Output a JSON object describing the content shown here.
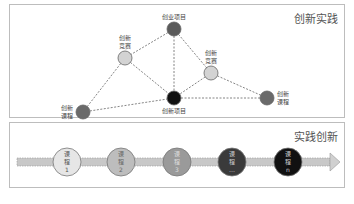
{
  "top_panel": {
    "title": "创新实践",
    "nodes": [
      {
        "id": "startup",
        "label_lines": [
          "创业项目"
        ],
        "color": "#5b5b5b",
        "label_pos": "above"
      },
      {
        "id": "comp1",
        "label_lines": [
          "创新",
          "竞赛"
        ],
        "color": "#d3d3d3",
        "label_pos": "above"
      },
      {
        "id": "comp2",
        "label_lines": [
          "创新",
          "竞赛"
        ],
        "color": "#d3d3d3",
        "label_pos": "above"
      },
      {
        "id": "project",
        "label_lines": [
          "创新项目"
        ],
        "color": "#111111",
        "label_pos": "below"
      },
      {
        "id": "course1",
        "label_lines": [
          "创新",
          "课程"
        ],
        "color": "#6a6a6a",
        "label_pos": "left"
      },
      {
        "id": "course2",
        "label_lines": [
          "创新",
          "课程"
        ],
        "color": "#6a6a6a",
        "label_pos": "right"
      }
    ],
    "edges": [
      [
        "startup",
        "comp1"
      ],
      [
        "startup",
        "project"
      ],
      [
        "startup",
        "comp2"
      ],
      [
        "comp1",
        "course1"
      ],
      [
        "comp1",
        "project"
      ],
      [
        "comp2",
        "project"
      ],
      [
        "comp2",
        "course2"
      ],
      [
        "course1",
        "project"
      ],
      [
        "project",
        "course2"
      ]
    ]
  },
  "bottom_panel": {
    "title": "实践创新",
    "courses": [
      {
        "lines": [
          "课",
          "程",
          "1"
        ],
        "fill": "#e6e6e6",
        "text": "#555555"
      },
      {
        "lines": [
          "课",
          "程",
          "2"
        ],
        "fill": "#bdbdbd",
        "text": "#666666"
      },
      {
        "lines": [
          "课",
          "程",
          "3"
        ],
        "fill": "#9a9a9a",
        "text": "#dddddd"
      },
      {
        "lines": [
          "课",
          "程",
          "…"
        ],
        "fill": "#3a3a3a",
        "text": "#cccccc"
      },
      {
        "lines": [
          "课",
          "程",
          "n"
        ],
        "fill": "#111111",
        "text": "#cccccc"
      }
    ]
  }
}
